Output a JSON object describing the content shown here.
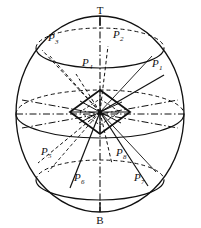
{
  "figure": {
    "type": "geometric-diagram",
    "background_color": "#ffffff",
    "ink_color": "#111111"
  },
  "poles": {
    "top": {
      "label": "T",
      "x": 100,
      "y": 14
    },
    "bottom": {
      "label": "B",
      "x": 100,
      "y": 216
    }
  },
  "sphere": {
    "cx": 100,
    "cy": 114,
    "rx": 84,
    "ry": 98
  },
  "circles": [
    {
      "name": "upper-latitude",
      "cy": 48,
      "rx": 64,
      "ry": 20
    },
    {
      "name": "equator",
      "cy": 114,
      "rx": 84,
      "ry": 24
    },
    {
      "name": "lower-latitude",
      "cy": 180,
      "rx": 64,
      "ry": 20
    }
  ],
  "octahedron": {
    "name": "central-octahedron",
    "cx": 100,
    "cy": 112,
    "half_width": 30,
    "half_height": 22
  },
  "points": [
    {
      "id": "P1",
      "label": "P",
      "sub": "1",
      "lx": 152,
      "ly": 67,
      "px": 164,
      "py": 75
    },
    {
      "id": "P2",
      "label": "P",
      "sub": "2",
      "lx": 113,
      "ly": 38,
      "px": 108,
      "py": 46
    },
    {
      "id": "P3",
      "label": "P",
      "sub": "3",
      "lx": 48,
      "ly": 41,
      "px": 42,
      "py": 50
    },
    {
      "id": "P4",
      "label": "P",
      "sub": "4",
      "lx": 82,
      "ly": 66,
      "px": 76,
      "py": 74
    },
    {
      "id": "P5",
      "label": "P",
      "sub": "5",
      "lx": 43,
      "ly": 155,
      "px": 38,
      "py": 163
    },
    {
      "id": "P6",
      "label": "P",
      "sub": "6",
      "lx": 75,
      "ly": 181,
      "px": 70,
      "py": 188
    },
    {
      "id": "P7",
      "label": "P",
      "sub": "7",
      "lx": 134,
      "ly": 181,
      "px": 148,
      "py": 186
    },
    {
      "id": "P8",
      "label": "P",
      "sub": "8",
      "lx": 116,
      "ly": 156,
      "px": 112,
      "py": 164
    }
  ],
  "legend": {
    "solid": "visible edge",
    "dashed": "hidden edge",
    "dashdot": "axis"
  }
}
